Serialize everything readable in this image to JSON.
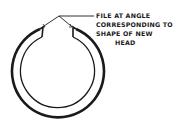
{
  "diagram": {
    "annotation": {
      "lines": [
        "FILE AT ANGLE",
        "CORRESPONDING TO",
        "SHAPE OF NEW",
        "HEAD"
      ]
    },
    "colors": {
      "ink": "#1a1a1a",
      "background": "#ffffff"
    }
  }
}
